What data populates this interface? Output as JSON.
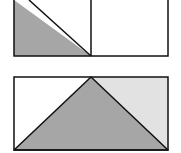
{
  "figure": {
    "width": 181,
    "height": 153,
    "colors": {
      "stroke": "#111111",
      "dark_fill": "#a6a6a6",
      "light_fill": "#e2e2e2",
      "blank_fill": "#ffffff"
    },
    "top_panel": {
      "description": "Rectangle split into two squares; left square has lower-left triangle shaded",
      "rect": {
        "x": 14,
        "y": 0,
        "w": 154,
        "h": 56
      },
      "divider_x": 91,
      "shaded_triangle": "14,0 91,56 14,56"
    },
    "bottom_panel": {
      "description": "Rectangle with central shaded triangle; upper-right corner lightly shaded",
      "rect": {
        "x": 14,
        "y": 77,
        "w": 154,
        "h": 73
      },
      "center_triangle": "14,150 91,77 168,150",
      "light_triangle": "91,77 168,77 168,150"
    }
  }
}
